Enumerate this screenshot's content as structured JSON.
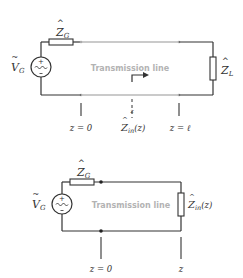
{
  "diagram_top": {
    "source_label": "V",
    "source_sub": "G",
    "generator_impedance_label": "Z",
    "generator_impedance_sub": "G",
    "load_impedance_label": "Z",
    "load_impedance_sub": "L",
    "line_label": "Transmission line",
    "position_z0": "z = 0",
    "position_zl": "z = ℓ",
    "position_z_mark": "z",
    "input_impedance_label": "Z",
    "input_impedance_sub": "in",
    "input_impedance_arg": "(z)"
  },
  "diagram_bottom": {
    "source_label": "V",
    "source_sub": "G",
    "generator_impedance_label": "Z",
    "generator_impedance_sub": "G",
    "line_label": "Transmission line",
    "input_impedance_label": "Z",
    "input_impedance_sub": "in",
    "input_impedance_arg": "(z)",
    "position_z0": "z = 0",
    "position_z": "z"
  },
  "colors": {
    "wire": "#333333",
    "line": "#b8b8b8",
    "line_label": "#b3b3b3"
  }
}
